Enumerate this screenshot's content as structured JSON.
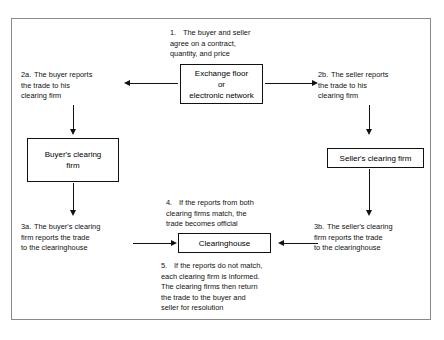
{
  "figure": {
    "title_fragment": "",
    "border_color": "#8a8a8a",
    "ink_color": "#111111",
    "background": "#ffffff"
  },
  "notes": {
    "n1": {
      "marker": "1.",
      "text": "The buyer and seller\nagree on a contract,\nquantity, and price"
    },
    "n2a": {
      "marker": "2a.",
      "text": "The buyer reports\nthe trade to his\nclearing firm"
    },
    "n2b": {
      "marker": "2b.",
      "text": "The seller reports\nthe trade to his\nclearing firm"
    },
    "n3a": {
      "marker": "3a.",
      "text": "The buyer's clearing\nfirm reports the trade\nto the clearinghouse"
    },
    "n3b": {
      "marker": "3b.",
      "text": "The seller's clearing\nfirm reports the trade\nto the clearinghouse"
    },
    "n4": {
      "marker": "4.",
      "text": "If the reports from both\nclearing firms match, the\ntrade becomes official"
    },
    "n5": {
      "marker": "5.",
      "text": "If the reports do not match,\neach clearing firm is informed.\nThe clearing firms then return\nthe trade to the buyer and\nseller for resolution"
    }
  },
  "boxes": {
    "exchange": {
      "label": "Exchange floor\nor\nelectronic network"
    },
    "buyer_clearing_firm": {
      "label": "Buyer's clearing\nfirm"
    },
    "seller_clearing_firm": {
      "label": "Seller's clearing firm"
    },
    "clearinghouse": {
      "label": "Clearinghouse"
    }
  }
}
